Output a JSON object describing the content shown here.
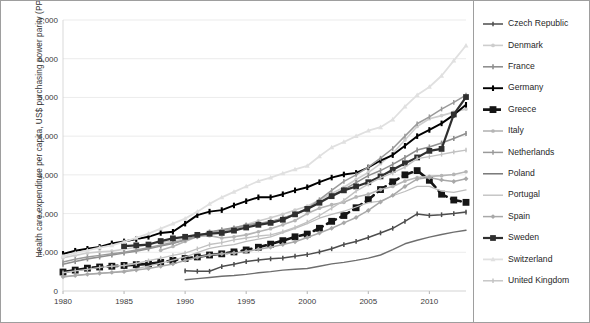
{
  "figure": {
    "axis_label_y": "Health care expenditure per capita, US$ purchasing power parity (PPP)",
    "axis_label_x": "",
    "background": "#ffffff",
    "frame_color": "#9e9e9e",
    "grid_color": "#e3e3e3"
  },
  "chart_data": {
    "type": "line",
    "title": "",
    "xlabel": "",
    "ylabel": "Health care expenditure per capita, US$ purchasing power parity (PPP)",
    "xlim": [
      1980,
      2013
    ],
    "ylim": [
      0,
      7000
    ],
    "xticks": [
      "1980",
      "1985",
      "1990",
      "1995",
      "2000",
      "2005",
      "2010"
    ],
    "xtick_values": [
      1980,
      1985,
      1990,
      1995,
      2000,
      2005,
      2010
    ],
    "yticks": [
      "0",
      "1,000",
      "2,000",
      "3,000",
      "4,000",
      "5,000",
      "6,000",
      "7,000"
    ],
    "ytick_values": [
      0,
      1000,
      2000,
      3000,
      4000,
      5000,
      6000,
      7000
    ],
    "grid": "horizontal",
    "legend_position": "right",
    "series": [
      {
        "name": "Czech Republic",
        "color": "#4d4d4d",
        "width": 1.5,
        "marker": "cross",
        "dash": "none",
        "x": [
          1990,
          1991,
          1992,
          1993,
          1994,
          1995,
          1996,
          1997,
          1998,
          1999,
          2000,
          2001,
          2002,
          2003,
          2004,
          2005,
          2006,
          2007,
          2008,
          2009,
          2010,
          2011,
          2012,
          2013
        ],
        "y": [
          520,
          510,
          510,
          630,
          690,
          760,
          800,
          830,
          850,
          900,
          940,
          1010,
          1090,
          1200,
          1280,
          1380,
          1500,
          1620,
          1800,
          1990,
          1950,
          1970,
          2000,
          2040
        ]
      },
      {
        "name": "Denmark",
        "color": "#cdcdcd",
        "width": 1.6,
        "marker": "circle",
        "dash": "none",
        "x": [
          1980,
          1981,
          1982,
          1983,
          1984,
          1985,
          1986,
          1987,
          1988,
          1989,
          1990,
          1991,
          1992,
          1993,
          1994,
          1995,
          1996,
          1997,
          1998,
          1999,
          2000,
          2001,
          2002,
          2003,
          2004,
          2005,
          2006,
          2007,
          2008,
          2009,
          2010,
          2011,
          2012,
          2013
        ],
        "y": [
          860,
          920,
          980,
          1010,
          1030,
          1080,
          1130,
          1210,
          1250,
          1290,
          1350,
          1400,
          1460,
          1560,
          1630,
          1720,
          1810,
          1890,
          1980,
          2090,
          2190,
          2350,
          2520,
          2680,
          2880,
          3060,
          3290,
          3550,
          3900,
          4250,
          4450,
          4530,
          4620,
          4700
        ]
      },
      {
        "name": "France",
        "color": "#8f8f8f",
        "width": 1.6,
        "marker": "cross",
        "dash": "none",
        "x": [
          1980,
          1981,
          1982,
          1983,
          1984,
          1985,
          1986,
          1987,
          1988,
          1989,
          1990,
          1991,
          1992,
          1993,
          1994,
          1995,
          1996,
          1997,
          1998,
          1999,
          2000,
          2001,
          2002,
          2003,
          2004,
          2005,
          2006,
          2007,
          2008,
          2009,
          2010,
          2011,
          2012,
          2013
        ],
        "y": [
          690,
          760,
          830,
          880,
          930,
          980,
          1030,
          1090,
          1160,
          1230,
          1320,
          1420,
          1520,
          1580,
          1630,
          1700,
          1750,
          1790,
          1880,
          1980,
          2120,
          2290,
          2470,
          2620,
          2800,
          2980,
          3110,
          3270,
          3450,
          3640,
          3720,
          3820,
          3940,
          4070
        ]
      },
      {
        "name": "Germany",
        "color": "#000000",
        "width": 1.9,
        "marker": "bar",
        "dash": "none",
        "x": [
          1980,
          1981,
          1982,
          1983,
          1984,
          1985,
          1986,
          1987,
          1988,
          1989,
          1990,
          1991,
          1992,
          1993,
          1994,
          1995,
          1996,
          1997,
          1998,
          1999,
          2000,
          2001,
          2002,
          2003,
          2004,
          2005,
          2006,
          2007,
          2008,
          2009,
          2010,
          2011,
          2012,
          2013
        ],
        "y": [
          960,
          1040,
          1090,
          1140,
          1230,
          1280,
          1340,
          1400,
          1500,
          1530,
          1740,
          1960,
          2050,
          2090,
          2210,
          2320,
          2420,
          2420,
          2500,
          2600,
          2680,
          2810,
          2930,
          3010,
          3050,
          3190,
          3370,
          3510,
          3750,
          4000,
          4160,
          4330,
          4550,
          4810
        ]
      },
      {
        "name": "Greece",
        "color": "#151515",
        "width": 2.6,
        "marker": "square",
        "dash": "10 5",
        "x": [
          1980,
          1981,
          1982,
          1983,
          1984,
          1985,
          1986,
          1987,
          1988,
          1989,
          1990,
          1991,
          1992,
          1993,
          1994,
          1995,
          1996,
          1997,
          1998,
          1999,
          2000,
          2001,
          2002,
          2003,
          2004,
          2005,
          2006,
          2007,
          2008,
          2009,
          2010,
          2011,
          2012,
          2013
        ],
        "y": [
          490,
          540,
          590,
          620,
          640,
          660,
          680,
          700,
          740,
          790,
          840,
          880,
          930,
          960,
          1010,
          1060,
          1130,
          1210,
          1300,
          1400,
          1470,
          1620,
          1800,
          1950,
          2150,
          2360,
          2620,
          2820,
          3000,
          3110,
          2860,
          2500,
          2350,
          2290
        ]
      },
      {
        "name": "Italy",
        "color": "#b5b5b5",
        "width": 1.6,
        "marker": "circle",
        "dash": "none",
        "x": [
          1988,
          1989,
          1990,
          1991,
          1992,
          1993,
          1994,
          1995,
          1996,
          1997,
          1998,
          1999,
          2000,
          2001,
          2002,
          2003,
          2004,
          2005,
          2006,
          2007,
          2008,
          2009,
          2010,
          2011,
          2012,
          2013
        ],
        "y": [
          1050,
          1150,
          1280,
          1410,
          1430,
          1370,
          1400,
          1450,
          1530,
          1610,
          1710,
          1820,
          2000,
          2140,
          2230,
          2290,
          2430,
          2500,
          2620,
          2700,
          2840,
          2930,
          2960,
          2980,
          3010,
          3080
        ]
      },
      {
        "name": "Netherlands",
        "color": "#9a9a9a",
        "width": 1.5,
        "marker": "cross",
        "dash": "none",
        "x": [
          1980,
          1981,
          1982,
          1983,
          1984,
          1985,
          1986,
          1987,
          1988,
          1989,
          1990,
          1991,
          1992,
          1993,
          1994,
          1995,
          1996,
          1997,
          1998,
          1999,
          2000,
          2001,
          2002,
          2003,
          2004,
          2005,
          2006,
          2007,
          2008,
          2009,
          2010,
          2011,
          2012,
          2013
        ],
        "y": [
          750,
          820,
          880,
          920,
          960,
          1000,
          1060,
          1120,
          1190,
          1250,
          1320,
          1400,
          1520,
          1560,
          1610,
          1690,
          1740,
          1790,
          1880,
          1990,
          2130,
          2360,
          2600,
          2830,
          3000,
          3200,
          3430,
          3680,
          4000,
          4320,
          4500,
          4700,
          4870,
          5060
        ]
      },
      {
        "name": "Poland",
        "color": "#6e6e6e",
        "width": 1.4,
        "marker": "none",
        "dash": "none",
        "x": [
          1990,
          1991,
          1992,
          1993,
          1994,
          1995,
          1996,
          1997,
          1998,
          1999,
          2000,
          2001,
          2002,
          2003,
          2004,
          2005,
          2006,
          2007,
          2008,
          2009,
          2010,
          2011,
          2012,
          2013
        ],
        "y": [
          290,
          320,
          350,
          380,
          400,
          430,
          470,
          500,
          540,
          560,
          580,
          640,
          700,
          740,
          790,
          850,
          930,
          1070,
          1220,
          1310,
          1390,
          1460,
          1520,
          1570
        ]
      },
      {
        "name": "Portugal",
        "color": "#bdbdbd",
        "width": 1.3,
        "marker": "none",
        "dash": "none",
        "x": [
          1980,
          1981,
          1982,
          1983,
          1984,
          1985,
          1986,
          1987,
          1988,
          1989,
          1990,
          1991,
          1992,
          1993,
          1994,
          1995,
          1996,
          1997,
          1998,
          1999,
          2000,
          2001,
          2002,
          2003,
          2004,
          2005,
          2006,
          2007,
          2008,
          2009,
          2010,
          2011,
          2012,
          2013
        ],
        "y": [
          360,
          400,
          430,
          450,
          480,
          520,
          580,
          640,
          720,
          800,
          880,
          990,
          1100,
          1160,
          1200,
          1280,
          1340,
          1400,
          1510,
          1620,
          1740,
          1880,
          1980,
          2060,
          2170,
          2280,
          2320,
          2460,
          2570,
          2700,
          2700,
          2580,
          2550,
          2610
        ]
      },
      {
        "name": "Spain",
        "color": "#a8a8a8",
        "width": 1.5,
        "marker": "diamond",
        "dash": "none",
        "x": [
          1980,
          1981,
          1982,
          1983,
          1984,
          1985,
          1986,
          1987,
          1988,
          1989,
          1990,
          1991,
          1992,
          1993,
          1994,
          1995,
          1996,
          1997,
          1998,
          1999,
          2000,
          2001,
          2002,
          2003,
          2004,
          2005,
          2006,
          2007,
          2008,
          2009,
          2010,
          2011,
          2012,
          2013
        ],
        "y": [
          370,
          400,
          430,
          460,
          480,
          500,
          540,
          580,
          640,
          700,
          790,
          870,
          930,
          960,
          980,
          1020,
          1080,
          1130,
          1200,
          1270,
          1380,
          1500,
          1620,
          1760,
          1900,
          2080,
          2300,
          2470,
          2700,
          2890,
          2930,
          2870,
          2830,
          2900
        ]
      },
      {
        "name": "Sweden",
        "color": "#2f2f2f",
        "width": 2.2,
        "marker": "square",
        "dash": "none",
        "x": [
          1985,
          1986,
          1987,
          1988,
          1989,
          1990,
          1991,
          1992,
          1993,
          1994,
          1995,
          1996,
          1997,
          1998,
          1999,
          2000,
          2001,
          2002,
          2003,
          2004,
          2005,
          2006,
          2007,
          2008,
          2009,
          2010,
          2011,
          2012,
          2013
        ],
        "y": [
          1160,
          1180,
          1200,
          1290,
          1360,
          1400,
          1450,
          1480,
          1500,
          1560,
          1640,
          1710,
          1760,
          1840,
          1980,
          2120,
          2280,
          2450,
          2600,
          2700,
          2810,
          2960,
          3130,
          3300,
          3450,
          3620,
          3670,
          4560,
          5010
        ]
      },
      {
        "name": "Switzerland",
        "color": "#e0e0e0",
        "width": 1.8,
        "marker": "triangle",
        "dash": "none",
        "x": [
          1980,
          1981,
          1982,
          1983,
          1984,
          1985,
          1986,
          1987,
          1988,
          1989,
          1990,
          1991,
          1992,
          1993,
          1994,
          1995,
          1996,
          1997,
          1998,
          1999,
          2000,
          2001,
          2002,
          2003,
          2004,
          2005,
          2006,
          2007,
          2008,
          2009,
          2010,
          2011,
          2012,
          2013
        ],
        "y": [
          900,
          980,
          1050,
          1120,
          1180,
          1270,
          1370,
          1480,
          1610,
          1740,
          1870,
          2050,
          2250,
          2420,
          2560,
          2700,
          2840,
          2930,
          3040,
          3140,
          3230,
          3480,
          3710,
          3850,
          4000,
          4140,
          4230,
          4430,
          4760,
          5060,
          5270,
          5560,
          5950,
          6340
        ]
      },
      {
        "name": "United Kingdom",
        "color": "#c2c2c2",
        "width": 1.4,
        "marker": "cross",
        "dash": "none",
        "x": [
          1980,
          1981,
          1982,
          1983,
          1984,
          1985,
          1986,
          1987,
          1988,
          1989,
          1990,
          1991,
          1992,
          1993,
          1994,
          1995,
          1996,
          1997,
          1998,
          1999,
          2000,
          2001,
          2002,
          2003,
          2004,
          2005,
          2006,
          2007,
          2008,
          2009,
          2010,
          2011,
          2012,
          2013
        ],
        "y": [
          470,
          520,
          560,
          610,
          640,
          660,
          710,
          780,
          850,
          920,
          980,
          1090,
          1200,
          1250,
          1320,
          1370,
          1420,
          1450,
          1530,
          1640,
          1780,
          1950,
          2140,
          2340,
          2580,
          2760,
          2920,
          3050,
          3200,
          3420,
          3470,
          3530,
          3590,
          3640
        ]
      }
    ]
  },
  "legend": {
    "items": [
      {
        "label": "Czech Republic"
      },
      {
        "label": "Denmark"
      },
      {
        "label": "France"
      },
      {
        "label": "Germany"
      },
      {
        "label": "Greece"
      },
      {
        "label": "Italy"
      },
      {
        "label": "Netherlands"
      },
      {
        "label": "Poland"
      },
      {
        "label": "Portugal"
      },
      {
        "label": "Spain"
      },
      {
        "label": "Sweden"
      },
      {
        "label": "Switzerland"
      },
      {
        "label": "United Kingdom"
      }
    ]
  }
}
